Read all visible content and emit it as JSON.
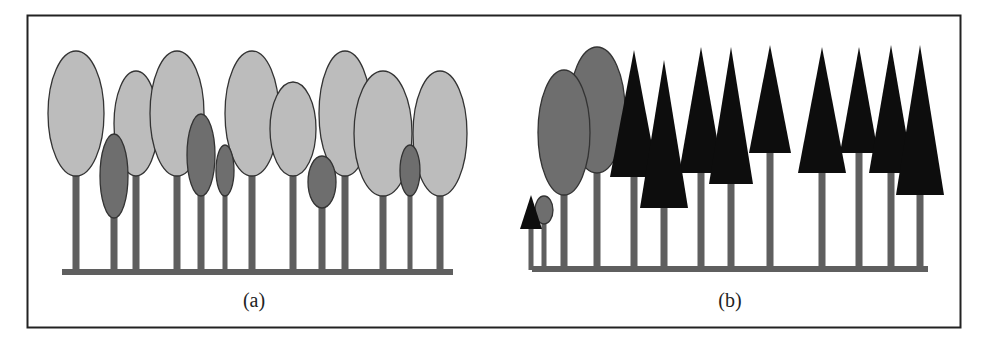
{
  "figure": {
    "colors": {
      "frame": "#222222",
      "trunk": "#5f5f5f",
      "light_crown": "#bcbcbc",
      "dark_crown": "#6e6e6e",
      "conifer": "#0d0d0d",
      "outline": "#333333"
    },
    "panels": [
      {
        "id": "a",
        "caption": "(a)",
        "caption_pos": [
          254,
          307
        ],
        "ground": {
          "x1": 62,
          "x2": 453,
          "y": 271
        },
        "broadleaf_trees": [
          {
            "cx": 76,
            "top": 51,
            "bottom": 176,
            "w": 56,
            "shade": "light"
          },
          {
            "cx": 136,
            "top": 71,
            "bottom": 176,
            "w": 44,
            "shade": "light"
          },
          {
            "cx": 177,
            "top": 51,
            "bottom": 176,
            "w": 54,
            "shade": "light"
          },
          {
            "cx": 252,
            "top": 51,
            "bottom": 176,
            "w": 54,
            "shade": "light"
          },
          {
            "cx": 293,
            "top": 82,
            "bottom": 176,
            "w": 46,
            "shade": "light"
          },
          {
            "cx": 345,
            "top": 51,
            "bottom": 176,
            "w": 52,
            "shade": "light"
          },
          {
            "cx": 383,
            "top": 71,
            "bottom": 196,
            "w": 58,
            "shade": "light"
          },
          {
            "cx": 440,
            "top": 71,
            "bottom": 196,
            "w": 54,
            "shade": "light"
          },
          {
            "cx": 114,
            "top": 134,
            "bottom": 218,
            "w": 28,
            "shade": "dark"
          },
          {
            "cx": 201,
            "top": 114,
            "bottom": 196,
            "w": 28,
            "shade": "dark"
          },
          {
            "cx": 225,
            "top": 145,
            "bottom": 196,
            "w": 18,
            "shade": "dark"
          },
          {
            "cx": 322,
            "top": 156,
            "bottom": 208,
            "w": 28,
            "shade": "dark"
          },
          {
            "cx": 410,
            "top": 145,
            "bottom": 196,
            "w": 20,
            "shade": "dark"
          }
        ],
        "conifer_trees": []
      },
      {
        "id": "b",
        "caption": "(b)",
        "caption_pos": [
          730,
          307
        ],
        "ground": {
          "x1": 532,
          "x2": 928,
          "y": 268
        },
        "broadleaf_trees": [
          {
            "cx": 564,
            "top": 70,
            "bottom": 195,
            "w": 52,
            "shade": "dark"
          },
          {
            "cx": 597,
            "top": 47,
            "bottom": 173,
            "w": 56,
            "shade": "dark"
          },
          {
            "cx": 544,
            "top": 196,
            "bottom": 224,
            "w": 18,
            "shade": "dark"
          }
        ],
        "conifer_trees": [
          {
            "x": 531,
            "apex": 195,
            "base": 229,
            "hw": 11
          },
          {
            "x": 634,
            "apex": 50,
            "base": 177,
            "hw": 24
          },
          {
            "x": 664,
            "apex": 60,
            "base": 208,
            "hw": 24
          },
          {
            "x": 701,
            "apex": 47,
            "base": 173,
            "hw": 22
          },
          {
            "x": 731,
            "apex": 47,
            "base": 184,
            "hw": 22
          },
          {
            "x": 770,
            "apex": 45,
            "base": 153,
            "hw": 21
          },
          {
            "x": 822,
            "apex": 47,
            "base": 173,
            "hw": 24
          },
          {
            "x": 859,
            "apex": 47,
            "base": 153,
            "hw": 19
          },
          {
            "x": 891,
            "apex": 45,
            "base": 173,
            "hw": 22
          },
          {
            "x": 920,
            "apex": 45,
            "base": 195,
            "hw": 24
          }
        ]
      }
    ]
  }
}
